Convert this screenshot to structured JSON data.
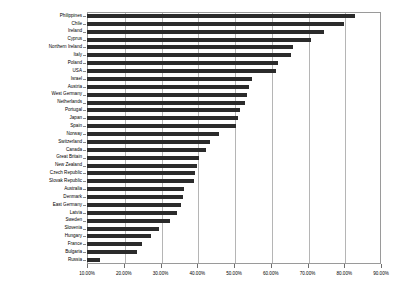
{
  "chart_data": {
    "type": "bar",
    "orientation": "horizontal",
    "title": "",
    "subtitle": "",
    "xlabel": "",
    "ylabel": "",
    "xlim": [
      10,
      90
    ],
    "xticks": [
      10,
      20,
      30,
      40,
      50,
      60,
      70,
      80,
      90
    ],
    "xtick_labels": [
      "10.00%",
      "20.00%",
      "30.00%",
      "40.00%",
      "50.00%",
      "60.00%",
      "70.00%",
      "80.00%",
      "90.00%"
    ],
    "grid": true,
    "grid_axis": "x",
    "legend": false,
    "bar_color": "#2b2b2b",
    "baseline": 10,
    "categories": [
      "Philippines",
      "Chile",
      "Ireland",
      "Cyprus",
      "Northern Ireland",
      "Italy",
      "Poland",
      "USA",
      "Israel",
      "Austria",
      "West Germany",
      "Netherlands",
      "Portugal",
      "Japan",
      "Spain",
      "Norway",
      "Switzerland",
      "Canada",
      "Great Britain",
      "New Zealand",
      "Czech Republic",
      "Slovak Republic",
      "Australia",
      "Denmark",
      "East Germany",
      "Latvia",
      "Sweden",
      "Slovenia",
      "Hungary",
      "France",
      "Bulgaria",
      "Russia"
    ],
    "values": [
      83.0,
      80.0,
      74.5,
      71.0,
      66.0,
      65.5,
      62.0,
      61.5,
      55.0,
      54.0,
      53.5,
      53.0,
      51.5,
      51.0,
      50.5,
      46.0,
      43.5,
      42.5,
      40.5,
      40.0,
      39.5,
      39.0,
      36.5,
      36.0,
      35.5,
      34.5,
      32.5,
      29.5,
      27.5,
      25.0,
      23.5,
      13.5
    ]
  }
}
